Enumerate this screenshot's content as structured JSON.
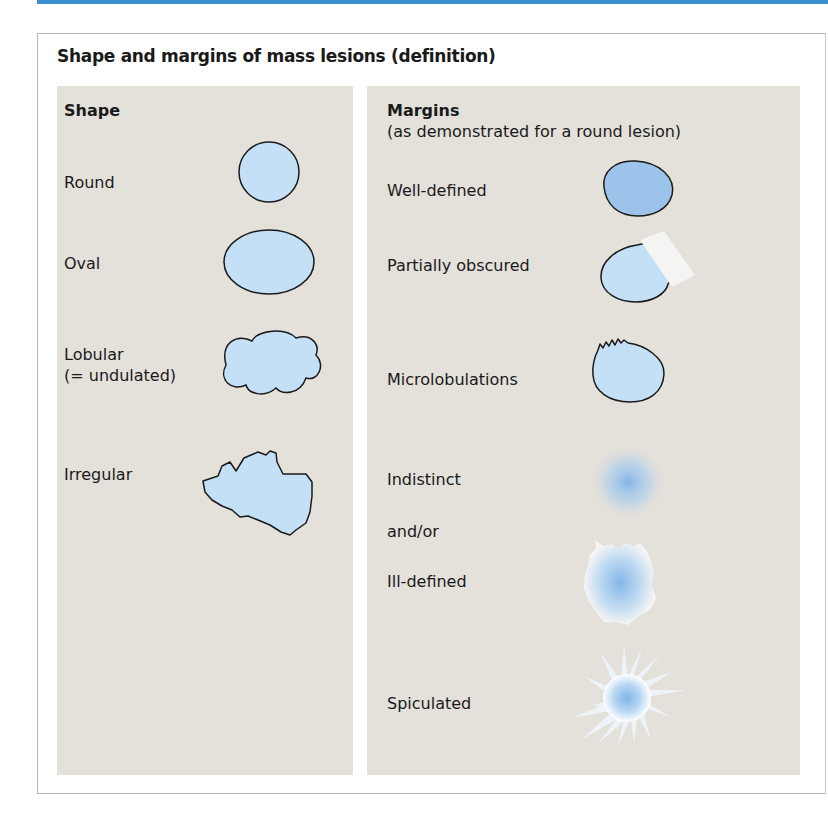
{
  "title": "Shape and margins of mass lesions (definition)",
  "colors": {
    "accent_bar": "#3a8fd0",
    "panel_bg": "#e4e0da",
    "lesion_fill": "#c4e0f7",
    "lesion_fill_dark": "#9cc3ea",
    "outline": "#1a1a1a"
  },
  "shape": {
    "header": "Shape",
    "items": [
      {
        "label": "Round",
        "icon": "round-lesion-icon"
      },
      {
        "label": "Oval",
        "icon": "oval-lesion-icon"
      },
      {
        "label_line1": "Lobular",
        "label_line2": "(= undulated)",
        "icon": "lobular-lesion-icon"
      },
      {
        "label": "Irregular",
        "icon": "irregular-lesion-icon"
      }
    ]
  },
  "margins": {
    "header": "Margins",
    "subheader": "(as demonstrated for a round lesion)",
    "items": [
      {
        "label": "Well-defined",
        "icon": "well-defined-lesion-icon"
      },
      {
        "label": "Partially obscured",
        "icon": "partially-obscured-lesion-icon"
      },
      {
        "label": "Microlobulations",
        "icon": "microlobulated-lesion-icon"
      },
      {
        "label": "Indistinct",
        "icon": "indistinct-lesion-icon"
      },
      {
        "label": "and/or"
      },
      {
        "label": "Ill-defined",
        "icon": "ill-defined-lesion-icon"
      },
      {
        "label": "Spiculated",
        "icon": "spiculated-lesion-icon"
      }
    ]
  }
}
